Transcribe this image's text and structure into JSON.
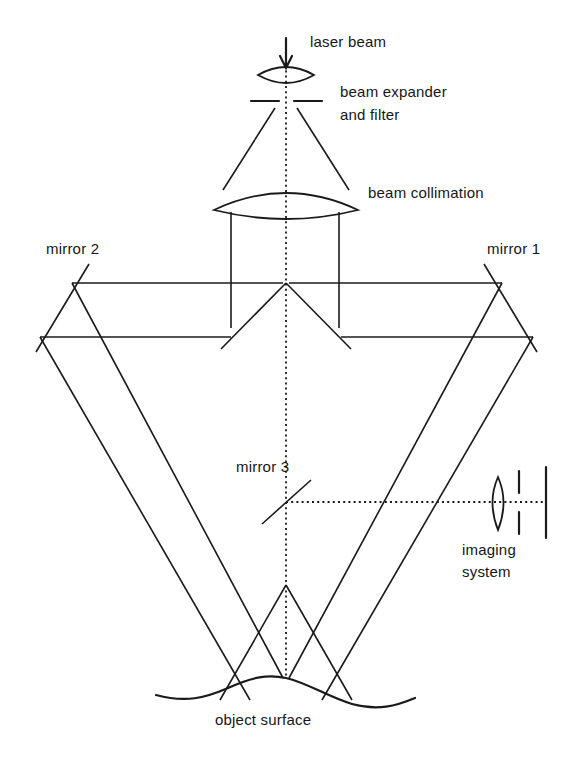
{
  "diagram": {
    "labels": {
      "laser_beam": "laser beam",
      "beam_expander_line1": "beam expander",
      "beam_expander_line2": "and filter",
      "beam_collimation": "beam collimation",
      "mirror_1": "mirror 1",
      "mirror_2": "mirror 2",
      "mirror_3": "mirror 3",
      "imaging_line1": "imaging",
      "imaging_line2": "system",
      "object_surface": "object surface"
    },
    "components": [
      {
        "name": "laser-beam-arrow",
        "type": "arrow",
        "label": "laser beam"
      },
      {
        "name": "beam-expander-lens",
        "type": "lens",
        "label": "beam expander and filter"
      },
      {
        "name": "spatial-filter-pinhole",
        "type": "aperture",
        "label": "and filter"
      },
      {
        "name": "collimating-lens",
        "type": "lens",
        "label": "beam collimation"
      },
      {
        "name": "mirror-1",
        "type": "mirror",
        "label": "mirror 1"
      },
      {
        "name": "mirror-2",
        "type": "mirror",
        "label": "mirror 2"
      },
      {
        "name": "mirror-3",
        "type": "mirror",
        "label": "mirror 3"
      },
      {
        "name": "beamsplitter-apex",
        "type": "splitter",
        "label": ""
      },
      {
        "name": "imaging-lens",
        "type": "lens",
        "label": "imaging system"
      },
      {
        "name": "imaging-aperture",
        "type": "aperture",
        "label": "imaging system"
      },
      {
        "name": "image-plane",
        "type": "screen",
        "label": "imaging system"
      },
      {
        "name": "object-surface",
        "type": "surface",
        "label": "object surface"
      }
    ],
    "colors": {
      "ink": "#1a1a1a",
      "background": "#ffffff",
      "text": "#161616"
    },
    "axis": {
      "optical_axis_x": 286,
      "imaging_axis_y": 502
    }
  }
}
